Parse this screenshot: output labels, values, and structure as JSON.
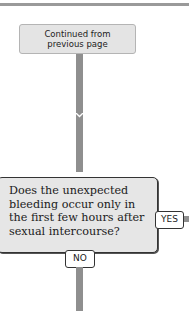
{
  "diagram": {
    "type": "flowchart",
    "start_node": {
      "lines": [
        "Continued from",
        "previous page"
      ]
    },
    "decision_node": {
      "lines": [
        "Does the unexpected",
        "bleeding occur only in",
        "the first few hours after",
        "sexual intercourse?"
      ]
    },
    "branches": {
      "yes_label": "YES",
      "no_label": "NO"
    },
    "colors": {
      "box_fill": "#e4e4e4",
      "connector": "#8f8f8f",
      "border": "#333333"
    }
  }
}
